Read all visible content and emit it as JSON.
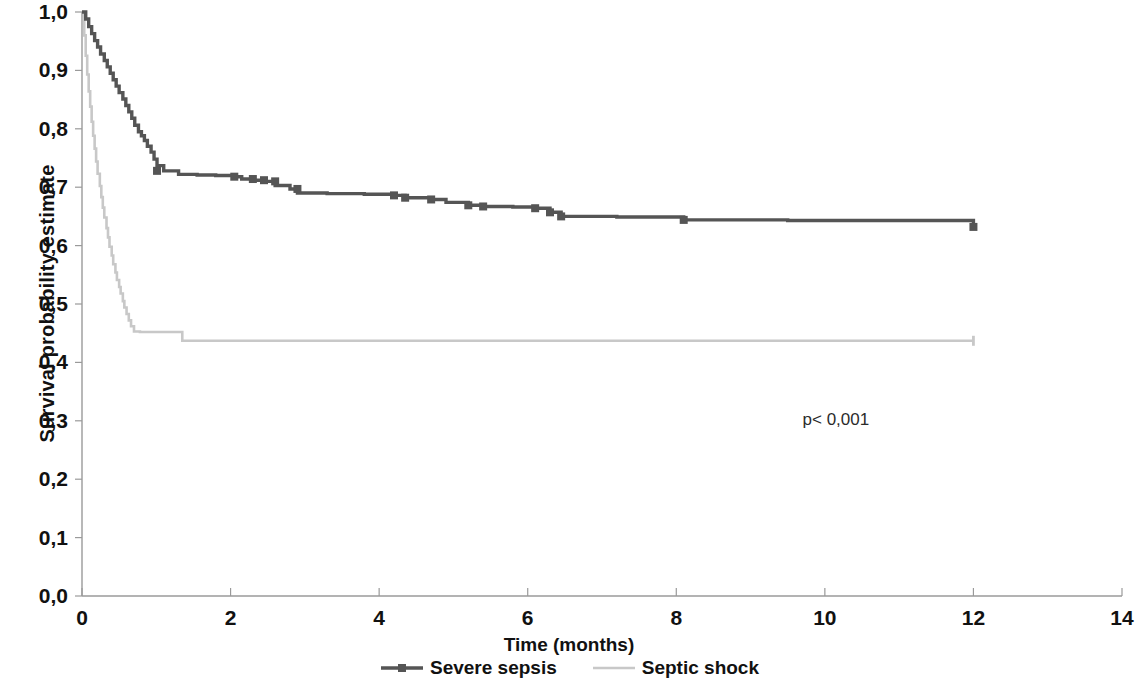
{
  "chart_data": {
    "type": "line",
    "title": "",
    "xlabel": "Time (months)",
    "ylabel": "Survival probability estimate",
    "xlim": [
      0,
      14
    ],
    "ylim": [
      0,
      1
    ],
    "grid": false,
    "legend_position": "bottom",
    "annotations": [
      {
        "text": "p< 0,001",
        "x": 9.7,
        "y": 0.318
      }
    ],
    "xticks": [
      0,
      2,
      4,
      6,
      8,
      10,
      12,
      14
    ],
    "xtick_labels": [
      "0",
      "2",
      "4",
      "6",
      "8",
      "10",
      "12",
      "14"
    ],
    "yticks": [
      0.0,
      0.1,
      0.2,
      0.3,
      0.4,
      0.5,
      0.6,
      0.7,
      0.8,
      0.9,
      1.0
    ],
    "ytick_labels": [
      "0,0",
      "0,1",
      "0,2",
      "0,3",
      "0,4",
      "0,5",
      "0,6",
      "0,7",
      "0,8",
      "0,9",
      "1,0"
    ],
    "series": [
      {
        "name": "Severe sepsis",
        "color": "#555555",
        "marker": "square",
        "step": "post",
        "x": [
          0.0,
          0.05,
          0.09,
          0.13,
          0.17,
          0.21,
          0.25,
          0.3,
          0.34,
          0.38,
          0.42,
          0.46,
          0.5,
          0.55,
          0.59,
          0.63,
          0.67,
          0.71,
          0.76,
          0.8,
          0.84,
          0.88,
          0.93,
          0.97,
          1.01,
          1.1,
          1.3,
          1.55,
          1.8,
          2.05,
          2.15,
          2.3,
          2.45,
          2.6,
          2.8,
          2.9,
          3.3,
          3.8,
          4.2,
          4.35,
          4.7,
          4.9,
          5.2,
          5.4,
          5.8,
          6.1,
          6.3,
          6.45,
          7.2,
          8.1,
          9.5,
          11.0,
          12.0
        ],
        "y": [
          1.0,
          0.988,
          0.975,
          0.963,
          0.951,
          0.94,
          0.928,
          0.917,
          0.906,
          0.895,
          0.884,
          0.873,
          0.862,
          0.851,
          0.84,
          0.829,
          0.818,
          0.806,
          0.795,
          0.788,
          0.78,
          0.77,
          0.76,
          0.748,
          0.737,
          0.728,
          0.722,
          0.721,
          0.72,
          0.718,
          0.714,
          0.712,
          0.71,
          0.703,
          0.697,
          0.69,
          0.689,
          0.688,
          0.686,
          0.682,
          0.679,
          0.674,
          0.669,
          0.667,
          0.666,
          0.664,
          0.657,
          0.65,
          0.649,
          0.644,
          0.643,
          0.643,
          0.632
        ],
        "censor_x": [
          1.01,
          2.05,
          2.3,
          2.45,
          2.6,
          2.9,
          4.2,
          4.35,
          4.7,
          5.2,
          5.4,
          6.1,
          6.3,
          6.45,
          8.1,
          12.0
        ],
        "censor_y": [
          0.728,
          0.718,
          0.714,
          0.712,
          0.71,
          0.697,
          0.686,
          0.682,
          0.679,
          0.669,
          0.667,
          0.664,
          0.657,
          0.65,
          0.644,
          0.632
        ]
      },
      {
        "name": "Septic shock",
        "color": "#c8c8c8",
        "marker": "none",
        "step": "post",
        "x": [
          0.0,
          0.03,
          0.05,
          0.07,
          0.09,
          0.11,
          0.13,
          0.15,
          0.17,
          0.19,
          0.21,
          0.24,
          0.26,
          0.28,
          0.3,
          0.33,
          0.35,
          0.37,
          0.4,
          0.42,
          0.45,
          0.47,
          0.5,
          0.52,
          0.55,
          0.57,
          0.6,
          0.63,
          0.66,
          0.7,
          0.78,
          0.95,
          1.1,
          1.28,
          1.35,
          2.5,
          4.0,
          6.0,
          8.0,
          10.0,
          12.0
        ],
        "y": [
          1.0,
          0.96,
          0.925,
          0.893,
          0.864,
          0.838,
          0.812,
          0.788,
          0.766,
          0.744,
          0.723,
          0.702,
          0.683,
          0.665,
          0.648,
          0.63,
          0.614,
          0.598,
          0.583,
          0.568,
          0.554,
          0.541,
          0.529,
          0.518,
          0.505,
          0.494,
          0.483,
          0.472,
          0.462,
          0.453,
          0.452,
          0.452,
          0.452,
          0.452,
          0.437,
          0.437,
          0.437,
          0.437,
          0.437,
          0.437,
          0.437
        ],
        "censor_x": [
          12.0
        ],
        "censor_y": [
          0.437
        ]
      }
    ]
  },
  "axes": {
    "plot_left_px": 82,
    "plot_right_px": 1122,
    "plot_top_px": 12,
    "plot_bottom_px": 596
  },
  "legend": {
    "items": [
      {
        "label": "Severe sepsis",
        "color": "#555555",
        "marker": "square"
      },
      {
        "label": "Septic shock",
        "color": "#c8c8c8",
        "marker": "none"
      }
    ]
  }
}
